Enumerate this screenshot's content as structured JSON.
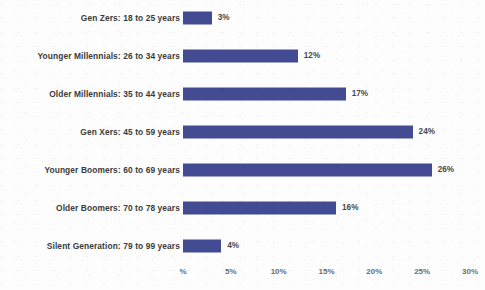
{
  "chart_data": {
    "type": "bar",
    "orientation": "horizontal",
    "title": "",
    "subtitle": "",
    "xlabel": "",
    "ylabel": "",
    "categories": [
      "Gen Zers: 18 to 25 years",
      "Younger Millennials: 26 to 34 years",
      "Older Millennials: 35 to 44 years",
      "Gen Xers: 45 to 59 years",
      "Younger Boomers: 60 to 69 years",
      "Older Boomers: 70 to 78 years",
      "Silent Generation: 79 to 99 years"
    ],
    "values": [
      3,
      12,
      17,
      24,
      26,
      16,
      4
    ],
    "value_labels": [
      "3%",
      "12%",
      "17%",
      "24%",
      "26%",
      "16%",
      "4%"
    ],
    "xlim": [
      0,
      30
    ],
    "xticks": [
      0,
      5,
      10,
      15,
      20,
      25,
      30
    ],
    "xticklabels": [
      "%",
      "5%",
      "10%",
      "15%",
      "20%",
      "25%",
      "30%"
    ],
    "grid": false,
    "legend": false,
    "bar_color": "#434c93",
    "label_color": "#3b3b3b",
    "tick_color": "#6e6e6e",
    "background_color": "#fdfdfd"
  }
}
